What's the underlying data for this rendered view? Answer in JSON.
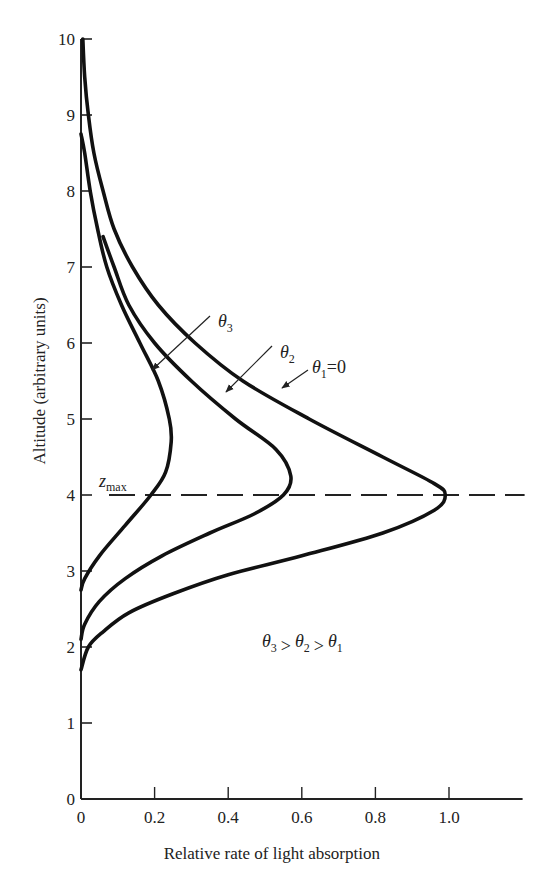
{
  "chart_data": {
    "type": "line",
    "title": "",
    "xlabel": "Relative rate of light absorption",
    "ylabel": "Altitude (arbitrary units)",
    "xlim": [
      0,
      1.2
    ],
    "ylim": [
      0,
      10
    ],
    "x_ticks": [
      "0",
      "0.2",
      "0.4",
      "0.6",
      "0.8",
      "1.0"
    ],
    "y_ticks": [
      "0",
      "1",
      "2",
      "3",
      "4",
      "5",
      "6",
      "7",
      "8",
      "9",
      "10"
    ],
    "grid": false,
    "legend": "none (curves labelled directly with arrows)",
    "reference_line": {
      "type": "horizontal dashed",
      "y": 4,
      "label": "z_max"
    },
    "annotation": "θ3 > θ2 > θ1",
    "series": [
      {
        "name": "θ1=0",
        "points": [
          [
            0.005,
            10.0
          ],
          [
            0.01,
            9.5
          ],
          [
            0.02,
            9.0
          ],
          [
            0.035,
            8.5
          ],
          [
            0.06,
            8.0
          ],
          [
            0.09,
            7.5
          ],
          [
            0.14,
            7.0
          ],
          [
            0.21,
            6.5
          ],
          [
            0.31,
            6.0
          ],
          [
            0.44,
            5.5
          ],
          [
            0.62,
            5.0
          ],
          [
            0.82,
            4.5
          ],
          [
            0.96,
            4.15
          ],
          [
            0.99,
            4.0
          ],
          [
            0.96,
            3.8
          ],
          [
            0.82,
            3.5
          ],
          [
            0.6,
            3.2
          ],
          [
            0.4,
            2.95
          ],
          [
            0.25,
            2.7
          ],
          [
            0.13,
            2.45
          ],
          [
            0.06,
            2.2
          ],
          [
            0.02,
            2.0
          ],
          [
            0.0,
            1.7
          ]
        ]
      },
      {
        "name": "θ2",
        "points": [
          [
            0.06,
            7.4
          ],
          [
            0.09,
            7.0
          ],
          [
            0.13,
            6.5
          ],
          [
            0.2,
            6.0
          ],
          [
            0.3,
            5.5
          ],
          [
            0.42,
            5.0
          ],
          [
            0.53,
            4.6
          ],
          [
            0.57,
            4.25
          ],
          [
            0.55,
            4.0
          ],
          [
            0.47,
            3.75
          ],
          [
            0.35,
            3.5
          ],
          [
            0.22,
            3.2
          ],
          [
            0.12,
            2.9
          ],
          [
            0.05,
            2.6
          ],
          [
            0.01,
            2.3
          ],
          [
            0.0,
            2.1
          ]
        ]
      },
      {
        "name": "θ3",
        "points": [
          [
            0.0,
            8.75
          ],
          [
            0.01,
            8.5
          ],
          [
            0.025,
            8.0
          ],
          [
            0.045,
            7.5
          ],
          [
            0.07,
            7.0
          ],
          [
            0.11,
            6.5
          ],
          [
            0.16,
            6.0
          ],
          [
            0.21,
            5.5
          ],
          [
            0.24,
            5.0
          ],
          [
            0.245,
            4.7
          ],
          [
            0.23,
            4.3
          ],
          [
            0.19,
            4.0
          ],
          [
            0.12,
            3.6
          ],
          [
            0.05,
            3.2
          ],
          [
            0.01,
            2.9
          ],
          [
            0.0,
            2.75
          ]
        ]
      }
    ],
    "curve_labels": [
      "θ3",
      "θ2",
      "θ1=0"
    ]
  }
}
